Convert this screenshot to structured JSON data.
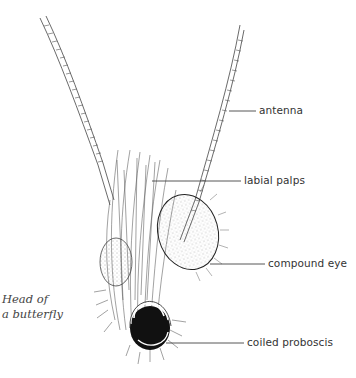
{
  "figure": {
    "caption_line1": "Head of",
    "caption_line2": "a butterfly",
    "labels": [
      {
        "id": "antenna",
        "text": "antenna"
      },
      {
        "id": "labial-palps",
        "text": "labial palps"
      },
      {
        "id": "compound-eye",
        "text": "compound eye"
      },
      {
        "id": "coiled-proboscis",
        "text": "coiled proboscis"
      }
    ],
    "colors": {
      "ink": "#333333",
      "background": "#ffffff"
    }
  }
}
